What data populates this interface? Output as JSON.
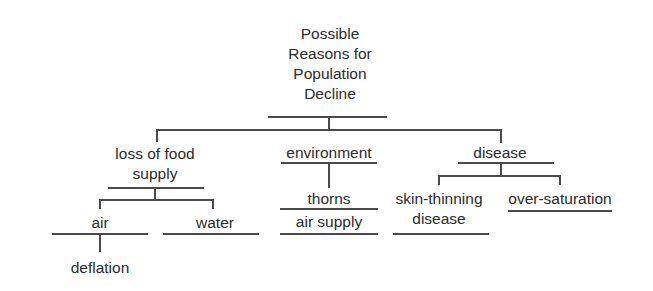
{
  "diagram": {
    "type": "tree",
    "root": {
      "label_lines": [
        "Possible",
        "Reasons for",
        "Population",
        "Decline"
      ]
    },
    "level1": [
      {
        "label_lines": [
          "loss of food",
          "supply"
        ],
        "children": [
          {
            "label": "air",
            "children": [
              {
                "label": "deflation"
              }
            ]
          },
          {
            "label": "water"
          }
        ]
      },
      {
        "label": "environment",
        "children": [
          {
            "label": "thorns"
          },
          {
            "label": "air supply"
          }
        ]
      },
      {
        "label": "disease",
        "children": [
          {
            "label_lines": [
              "skin-thinning",
              "disease"
            ]
          },
          {
            "label": "over-saturation"
          }
        ]
      }
    ]
  }
}
